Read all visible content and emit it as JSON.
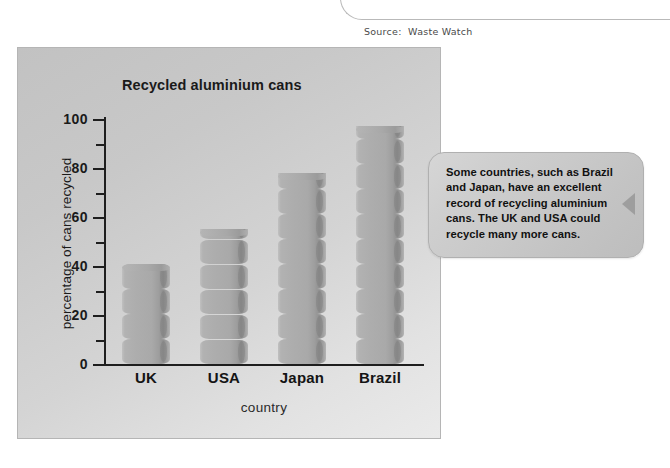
{
  "source": {
    "caption": "Source:  Waste Watch"
  },
  "chart_data": {
    "type": "bar",
    "title": "Recycled aluminium cans",
    "xlabel": "country",
    "ylabel": "percentage of cans recycled",
    "categories": [
      "UK",
      "USA",
      "Japan",
      "Brazil"
    ],
    "values": [
      41,
      55,
      78,
      97
    ],
    "ylim": [
      0,
      100
    ],
    "major_ticks": [
      "0",
      "20",
      "40",
      "60",
      "80",
      "100"
    ],
    "minor_ticks": [
      10,
      30,
      50,
      70,
      90
    ],
    "grid": false,
    "legend": null,
    "bar_style": "stacked-aluminium-can-pictogram",
    "colors": {
      "panel_background": "#cfcfcf",
      "bar_fill": "#a9a9a9",
      "axis": "#1e1e1e",
      "text": "#1a1a1a"
    }
  },
  "callout": {
    "text": "Some countries, such as Brazil and Japan, have an excellent record of recycling aluminium cans. The UK and USA could recycle many more cans.",
    "color": "#c9c9c9"
  }
}
